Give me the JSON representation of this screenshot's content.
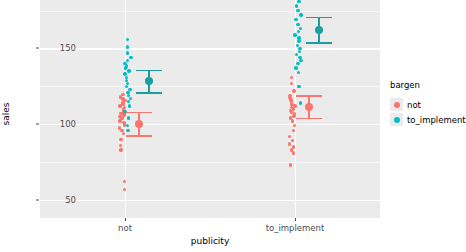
{
  "chart_data": {
    "type": "scatter",
    "title": "",
    "xlabel": "publicity",
    "ylabel": "sales",
    "categories": [
      "not",
      "to_implement"
    ],
    "ylim": [
      38,
      182
    ],
    "yticks": [
      50,
      100,
      150
    ],
    "ytick_labels": [
      "50",
      "100",
      "150"
    ],
    "grid": true,
    "legend": {
      "title": "bargen",
      "position": "right",
      "entries": [
        {
          "label": "not",
          "color": "#F8766D"
        },
        {
          "label": "to_implement",
          "color": "#00BFC4"
        }
      ]
    },
    "series": [
      {
        "name": "not",
        "color": "#F8766D",
        "points": [
          {
            "x": "not",
            "y": 119.5
          },
          {
            "x": "not",
            "y": 118.0
          },
          {
            "x": "not",
            "y": 116.5
          },
          {
            "x": "not",
            "y": 115.5
          },
          {
            "x": "not",
            "y": 114.0
          },
          {
            "x": "not",
            "y": 113.0
          },
          {
            "x": "not",
            "y": 112.0
          },
          {
            "x": "not",
            "y": 111.0
          },
          {
            "x": "not",
            "y": 110.0
          },
          {
            "x": "not",
            "y": 109.0
          },
          {
            "x": "not",
            "y": 108.0
          },
          {
            "x": "not",
            "y": 107.0
          },
          {
            "x": "not",
            "y": 106.0
          },
          {
            "x": "not",
            "y": 105.0
          },
          {
            "x": "not",
            "y": 104.0
          },
          {
            "x": "not",
            "y": 103.0
          },
          {
            "x": "not",
            "y": 102.0
          },
          {
            "x": "not",
            "y": 101.0
          },
          {
            "x": "not",
            "y": 100.0
          },
          {
            "x": "not",
            "y": 99.0
          },
          {
            "x": "not",
            "y": 97.5
          },
          {
            "x": "not",
            "y": 96.0
          },
          {
            "x": "not",
            "y": 94.0
          },
          {
            "x": "not",
            "y": 90.0
          },
          {
            "x": "not",
            "y": 86.0
          },
          {
            "x": "not",
            "y": 83.0
          },
          {
            "x": "not",
            "y": 62.0
          },
          {
            "x": "not",
            "y": 57.0
          },
          {
            "x": "to_implement",
            "y": 131.0
          },
          {
            "x": "to_implement",
            "y": 127.0
          },
          {
            "x": "to_implement",
            "y": 122.0
          },
          {
            "x": "to_implement",
            "y": 119.0
          },
          {
            "x": "to_implement",
            "y": 117.5
          },
          {
            "x": "to_implement",
            "y": 116.0
          },
          {
            "x": "to_implement",
            "y": 114.5
          },
          {
            "x": "to_implement",
            "y": 113.0
          },
          {
            "x": "to_implement",
            "y": 112.0
          },
          {
            "x": "to_implement",
            "y": 111.0
          },
          {
            "x": "to_implement",
            "y": 110.0
          },
          {
            "x": "to_implement",
            "y": 109.0
          },
          {
            "x": "to_implement",
            "y": 108.0
          },
          {
            "x": "to_implement",
            "y": 107.0
          },
          {
            "x": "to_implement",
            "y": 105.5
          },
          {
            "x": "to_implement",
            "y": 104.0
          },
          {
            "x": "to_implement",
            "y": 102.0
          },
          {
            "x": "to_implement",
            "y": 99.0
          },
          {
            "x": "to_implement",
            "y": 96.0
          },
          {
            "x": "to_implement",
            "y": 92.0
          },
          {
            "x": "to_implement",
            "y": 89.0
          },
          {
            "x": "to_implement",
            "y": 87.0
          },
          {
            "x": "to_implement",
            "y": 85.0
          },
          {
            "x": "to_implement",
            "y": 83.0
          },
          {
            "x": "to_implement",
            "y": 81.0
          },
          {
            "x": "to_implement",
            "y": 73.0
          }
        ]
      },
      {
        "name": "to_implement",
        "color": "#00BFC4",
        "points": [
          {
            "x": "not",
            "y": 156.0
          },
          {
            "x": "not",
            "y": 151.0
          },
          {
            "x": "not",
            "y": 147.0
          },
          {
            "x": "not",
            "y": 144.0
          },
          {
            "x": "not",
            "y": 142.0
          },
          {
            "x": "not",
            "y": 140.0
          },
          {
            "x": "not",
            "y": 138.5
          },
          {
            "x": "not",
            "y": 137.0
          },
          {
            "x": "not",
            "y": 135.0
          },
          {
            "x": "not",
            "y": 133.0
          },
          {
            "x": "not",
            "y": 131.0
          },
          {
            "x": "not",
            "y": 129.0
          },
          {
            "x": "not",
            "y": 127.0
          },
          {
            "x": "not",
            "y": 125.0
          },
          {
            "x": "not",
            "y": 123.0
          },
          {
            "x": "not",
            "y": 121.0
          },
          {
            "x": "not",
            "y": 119.0
          },
          {
            "x": "not",
            "y": 117.0
          },
          {
            "x": "not",
            "y": 115.0
          },
          {
            "x": "not",
            "y": 112.0
          },
          {
            "x": "not",
            "y": 108.0
          },
          {
            "x": "not",
            "y": 104.0
          },
          {
            "x": "not",
            "y": 99.0
          },
          {
            "x": "not",
            "y": 96.0
          },
          {
            "x": "to_implement",
            "y": 181.0
          },
          {
            "x": "to_implement",
            "y": 178.0
          },
          {
            "x": "to_implement",
            "y": 175.0
          },
          {
            "x": "to_implement",
            "y": 172.0
          },
          {
            "x": "to_implement",
            "y": 169.0
          },
          {
            "x": "to_implement",
            "y": 166.0
          },
          {
            "x": "to_implement",
            "y": 163.0
          },
          {
            "x": "to_implement",
            "y": 161.0
          },
          {
            "x": "to_implement",
            "y": 159.0
          },
          {
            "x": "to_implement",
            "y": 157.0
          },
          {
            "x": "to_implement",
            "y": 155.0
          },
          {
            "x": "to_implement",
            "y": 152.0
          },
          {
            "x": "to_implement",
            "y": 150.0
          },
          {
            "x": "to_implement",
            "y": 148.0
          },
          {
            "x": "to_implement",
            "y": 146.0
          },
          {
            "x": "to_implement",
            "y": 144.0
          },
          {
            "x": "to_implement",
            "y": 142.0
          },
          {
            "x": "to_implement",
            "y": 140.0
          },
          {
            "x": "to_implement",
            "y": 137.0
          },
          {
            "x": "to_implement",
            "y": 134.0
          },
          {
            "x": "to_implement",
            "y": 125.0
          },
          {
            "x": "to_implement",
            "y": 114.0
          }
        ]
      }
    ],
    "summaries": [
      {
        "x": "not",
        "group": "not",
        "mean": 100.0,
        "low": 92.5,
        "high": 108.0,
        "color": "#F8766D"
      },
      {
        "x": "not",
        "group": "to_implement",
        "mean": 128.5,
        "low": 121.0,
        "high": 136.0,
        "color": "#00BFC4"
      },
      {
        "x": "to_implement",
        "group": "not",
        "mean": 111.0,
        "low": 104.0,
        "high": 119.0,
        "color": "#F8766D"
      },
      {
        "x": "to_implement",
        "group": "to_implement",
        "mean": 162.5,
        "low": 154.0,
        "high": 171.0,
        "color": "#00BFC4"
      }
    ]
  },
  "colors": {
    "panel_bg": "#EBEBEB",
    "grid_major": "#FFFFFF",
    "grid_minor": "#F6F6F6",
    "not": "#F8766D",
    "to_implement": "#00BFC4",
    "axis_text": "#4D4D4D"
  }
}
